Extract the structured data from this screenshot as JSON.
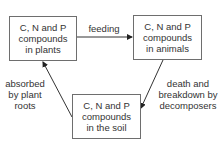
{
  "diagram": {
    "nodes": {
      "plants": {
        "lines": [
          "C, N and P",
          "compounds",
          "in plants"
        ]
      },
      "animals": {
        "lines": [
          "C, N and P",
          "compounds",
          "in animals"
        ]
      },
      "soil": {
        "lines": [
          "C, N and P",
          "compounds",
          "in the soil"
        ]
      }
    },
    "edges": {
      "feeding": {
        "from": "plants",
        "to": "animals",
        "lines": [
          "feeding"
        ]
      },
      "death": {
        "from": "animals",
        "to": "soil",
        "lines": [
          "death and",
          "breakdown by",
          "decomposers"
        ]
      },
      "absorbed": {
        "from": "soil",
        "to": "plants",
        "lines": [
          "absorbed",
          "by plant",
          "roots"
        ]
      }
    },
    "colors": {
      "line": "#333333",
      "border": "#6e6e6e",
      "text": "#333333"
    }
  }
}
